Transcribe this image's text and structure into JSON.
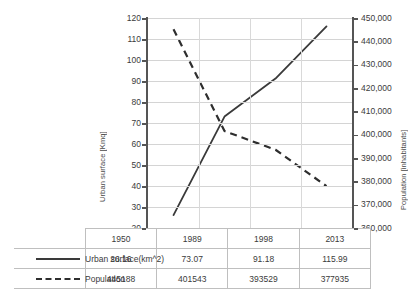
{
  "chart_data": {
    "type": "line",
    "title": "",
    "xlabel": "",
    "categories": [
      "1950",
      "1989",
      "1998",
      "2013"
    ],
    "grid": true,
    "legend_position": "table-below",
    "axes": {
      "left": {
        "label": "Urban surface [Kmq]",
        "ylim": [
          20,
          120
        ],
        "step": 10,
        "ticks": [
          "20",
          "30",
          "40",
          "50",
          "60",
          "70",
          "80",
          "90",
          "100",
          "110",
          "120"
        ]
      },
      "right": {
        "label": "Population [inhabitants]",
        "ylim": [
          360000,
          450000
        ],
        "step": 10000,
        "ticks": [
          "360,000",
          "370,000",
          "380,000",
          "390,000",
          "400,000",
          "410,000",
          "420,000",
          "430,000",
          "440,000",
          "450,000"
        ]
      }
    },
    "series": [
      {
        "name": "Urban surface(km^2)",
        "axis": "left",
        "style": "solid",
        "color": "#3a3a3a",
        "values": [
          26.16,
          73.07,
          91.18,
          115.99
        ]
      },
      {
        "name": "Population",
        "axis": "right",
        "style": "dashed",
        "color": "#2e2e2e",
        "values": [
          445188,
          401543,
          393529,
          377935
        ]
      }
    ]
  },
  "data_table": {
    "header": [
      "",
      "1950",
      "1989",
      "1998",
      "2013"
    ],
    "rows": [
      {
        "label": "Urban surface(km^2)",
        "swatch": "solid-line-swatch",
        "values": [
          "26.16",
          "73.07",
          "91.18",
          "115.99"
        ]
      },
      {
        "label": "Population",
        "swatch": "dashed-line-swatch",
        "values": [
          "445188",
          "401543",
          "393529",
          "377935"
        ]
      }
    ]
  }
}
